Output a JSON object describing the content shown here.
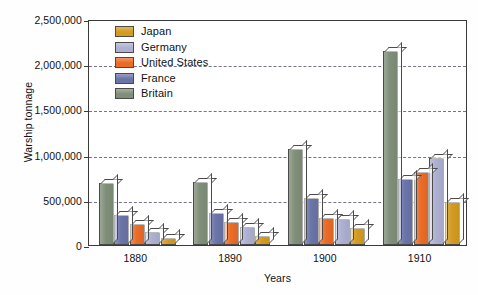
{
  "chart_data": {
    "type": "bar",
    "title": "",
    "xlabel": "Years",
    "ylabel": "Warship tonnage",
    "categories": [
      "1880",
      "1890",
      "1900",
      "1910"
    ],
    "ylim": [
      0,
      2500000
    ],
    "yticks": [
      0,
      500000,
      1000000,
      1500000,
      2000000,
      2500000
    ],
    "ytick_labels": [
      "0",
      "500,000",
      "1,000,000",
      "1,500,000",
      "2,000,000",
      "2,500,000"
    ],
    "grid": "horizontal-dashed",
    "legend_position": "upper-left-inside",
    "bar_order": [
      "Britain",
      "France",
      "United States",
      "Germany",
      "Japan"
    ],
    "series": [
      {
        "name": "Japan",
        "color": "#d39b20",
        "values": [
          80000,
          100000,
          190000,
          480000
        ]
      },
      {
        "name": "Germany",
        "color": "#aeb0d2",
        "values": [
          145000,
          200000,
          290000,
          960000
        ]
      },
      {
        "name": "United States",
        "color": "#ea6b26",
        "values": [
          235000,
          255000,
          300000,
          810000
        ]
      },
      {
        "name": "France",
        "color": "#6b74a8",
        "values": [
          330000,
          355000,
          520000,
          725000
        ]
      },
      {
        "name": "Britain",
        "color": "#7f8f79",
        "values": [
          690000,
          700000,
          1060000,
          2150000
        ]
      }
    ]
  },
  "legend": {
    "items": [
      {
        "label": "Japan",
        "color": "#d39b20"
      },
      {
        "label": "Germany",
        "color": "#aeb0d2"
      },
      {
        "label": "United States",
        "color": "#ea6b26"
      },
      {
        "label": "France",
        "color": "#6b74a8"
      },
      {
        "label": "Britain",
        "color": "#7f8f79"
      }
    ]
  },
  "axes": {
    "y_title": "Warship tonnage",
    "x_title": "Years"
  }
}
